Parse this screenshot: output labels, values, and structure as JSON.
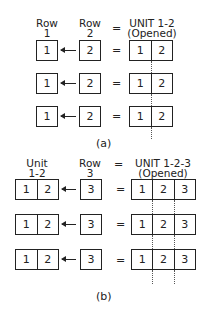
{
  "part_a": {
    "headers": {
      "row1": [
        "Row",
        "1"
      ],
      "row2": [
        "Row",
        "2"
      ],
      "equals": "=",
      "unit": [
        "UNIT 1-2",
        "(Opened)"
      ]
    },
    "rows": [
      {
        "left": "1",
        "right": "2",
        "equals": "=",
        "unit_cells": [
          "1",
          "2"
        ]
      },
      {
        "left": "1",
        "right": "2",
        "equals": "=",
        "unit_cells": [
          "1",
          "2"
        ]
      },
      {
        "left": "1",
        "right": "2",
        "equals": "=",
        "unit_cells": [
          "1",
          "2"
        ]
      }
    ],
    "caption": "(a)"
  },
  "part_b": {
    "headers": {
      "unit12": [
        "Unit",
        "1-2"
      ],
      "row3": [
        "Row",
        "3"
      ],
      "equals": "=",
      "unit": [
        "UNIT 1-2-3",
        "(Opened)"
      ]
    },
    "rows": [
      {
        "left_cells": [
          "1",
          "2"
        ],
        "right": "3",
        "equals": "=",
        "unit_cells": [
          "1",
          "2",
          "3"
        ]
      },
      {
        "left_cells": [
          "1",
          "2"
        ],
        "right": "3",
        "equals": "=",
        "unit_cells": [
          "1",
          "2",
          "3"
        ]
      },
      {
        "left_cells": [
          "1",
          "2"
        ],
        "right": "3",
        "equals": "=",
        "unit_cells": [
          "1",
          "2",
          "3"
        ]
      }
    ],
    "caption": "(b)"
  }
}
